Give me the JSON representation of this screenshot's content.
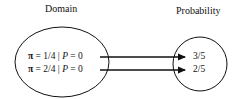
{
  "diagram": {
    "domain_label": "Domain",
    "codomain_label": "Probability",
    "mappings": [
      {
        "pi_symbol": "π",
        "pi_value": "= 1/4",
        "separator": "|",
        "condition_var": "P",
        "condition_value": "= 0",
        "target": "3/5"
      },
      {
        "pi_symbol": "π",
        "pi_value": "= 2/4",
        "separator": "|",
        "condition_var": "P",
        "condition_value": "= 0",
        "target": "2/5"
      }
    ],
    "colors": {
      "stroke": "#111111",
      "background": "#ffffff"
    }
  }
}
